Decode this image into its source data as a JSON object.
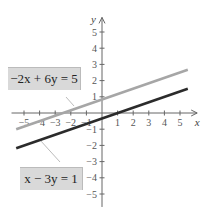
{
  "chart_data": {
    "type": "line",
    "title": "",
    "xlabel": "x",
    "ylabel": "y",
    "xlim": [
      -5.8,
      6.2
    ],
    "ylim": [
      -5.8,
      6
    ],
    "x_ticks": [
      -5,
      -4,
      -3,
      -2,
      -1,
      1,
      2,
      3,
      4,
      5
    ],
    "y_ticks": [
      5,
      4,
      3,
      2,
      1,
      -1,
      -2,
      -3,
      -4,
      -5
    ],
    "grid": false,
    "series": [
      {
        "name": "-2x + 6y = 5",
        "color": "#a6a6a6",
        "equation": "y = (2x + 5) / 6",
        "x": [
          -5.5,
          5.5
        ],
        "y": [
          -1.0,
          2.67
        ]
      },
      {
        "name": "x - 3y = 1",
        "color": "#2b2b2b",
        "equation": "y = (x - 1) / 3",
        "x": [
          -5.5,
          5.5
        ],
        "y": [
          -2.17,
          1.5
        ]
      }
    ],
    "annotations": [
      {
        "text": "-2x + 6y = 5",
        "points_to": "gray line"
      },
      {
        "text": "x - 3y = 1",
        "points_to": "black line"
      }
    ]
  },
  "labels": {
    "x_axis": "x",
    "y_axis": "y",
    "eq1": "−2x + 6y = 5",
    "eq2": "x − 3y = 1"
  }
}
